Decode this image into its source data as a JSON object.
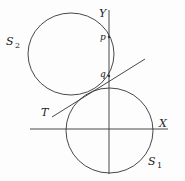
{
  "diagram": {
    "colors": {
      "stroke": "#333333",
      "background": "#fdfdfd",
      "text": "#222222"
    },
    "axes": {
      "x_label": "X",
      "y_label": "Y"
    },
    "circles": [
      {
        "id": "S1",
        "label": "S",
        "subscript": "1"
      },
      {
        "id": "S2",
        "label": "S",
        "subscript": "2"
      }
    ],
    "tangent": {
      "label": "T"
    },
    "points": [
      {
        "id": "p",
        "label": "p"
      },
      {
        "id": "q",
        "label": "q"
      }
    ]
  }
}
